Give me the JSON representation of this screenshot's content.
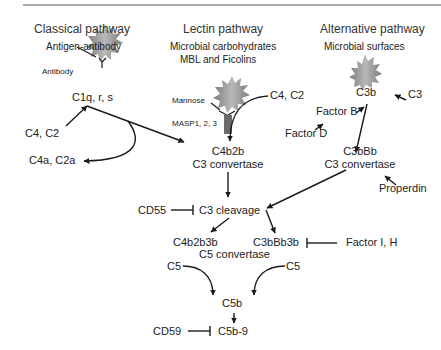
{
  "pathways": {
    "classical": {
      "title": "Classical pathway",
      "trigger": "Antigen-antibody",
      "antibody_label": "Antibody",
      "complex": "C1q, r, s",
      "substrates": "C4, C2",
      "byproducts": "C4a, C2a"
    },
    "lectin": {
      "title": "Lectin pathway",
      "trigger_line1": "Microbial carbohydrates",
      "trigger_line2": "MBL and Ficolins",
      "mannose_label": "Mannose",
      "masp_label": "MASP1, 2, 3",
      "substrates": "C4, C2"
    },
    "alternative": {
      "title": "Alternative pathway",
      "trigger": "Microbial surfaces",
      "c3b": "C3b",
      "c3": "C3",
      "factor_b": "Factor B",
      "factor_d": "Factor D",
      "c3_convertase_name": "C3bBb",
      "c3_convertase_label": "C3 convertase",
      "properdin": "Properdin"
    }
  },
  "shared": {
    "c4b2b": "C4b2b",
    "c4b2b_label": "C3 convertase",
    "cd55": "CD55",
    "c3_cleavage": "C3 cleavage",
    "c4b2b3b": "C4b2b3b",
    "c3bbb3b": "C3bBb3b",
    "c5_convertase_label": "C5 convertase",
    "factor_ih": "Factor I, H",
    "c5_left": "C5",
    "c5_right": "C5",
    "c5b": "C5b",
    "cd59": "CD59",
    "mac": "C5b-9"
  },
  "icons": {
    "microbe": "spiky-microbe-icon",
    "antibody": "y-shaped-antibody-icon",
    "masp": "masp-receptor-icon"
  },
  "colors": {
    "background": "#ffffff",
    "text": "#222222",
    "line": "#1a1a1a",
    "microbe_fill": "#9a9a9a",
    "masp_fill": "#6a6a6a",
    "top_rule": "#a8a8a8"
  }
}
